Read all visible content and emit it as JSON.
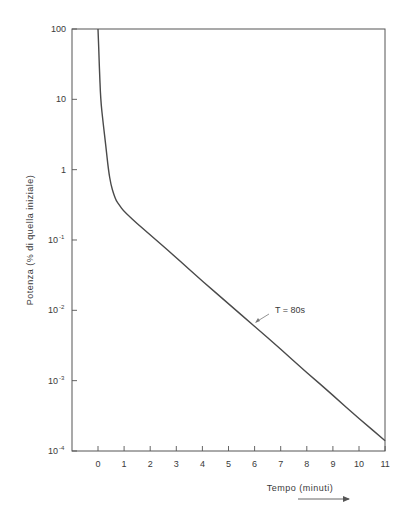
{
  "chart_data": {
    "type": "line",
    "title": "",
    "xlabel": "Tempo (minuti)",
    "ylabel": "Potenza (% di quella iniziale)",
    "xlim": [
      -1,
      11
    ],
    "ylim": [
      0.0001,
      100
    ],
    "yscale": "log",
    "grid": false,
    "x_ticks": [
      "0",
      "1",
      "2",
      "3",
      "4",
      "5",
      "6",
      "7",
      "8",
      "9",
      "10",
      "11"
    ],
    "y_ticks": [
      "100",
      "10",
      "1",
      "10^-1",
      "10^-2",
      "10^-3",
      "10^-4"
    ],
    "series": [
      {
        "name": "Potenza residua",
        "x": [
          0,
          0.05,
          0.1,
          0.2,
          0.3,
          0.4,
          0.5,
          0.6,
          0.7,
          0.8,
          1,
          2,
          3,
          4,
          5,
          6,
          7,
          8,
          9,
          10,
          11
        ],
        "values": [
          100,
          30,
          10,
          4.5,
          2.2,
          1.0,
          0.6,
          0.45,
          0.36,
          0.32,
          0.25,
          0.118,
          0.056,
          0.026,
          0.0124,
          0.0059,
          0.0028,
          0.0013,
          0.00062,
          0.00029,
          0.00014
        ]
      }
    ],
    "annotations": [
      {
        "text": "T = 80s",
        "x": 6.1,
        "y": 0.0069,
        "arrow": true
      }
    ]
  },
  "axes": {
    "x_title": "Tempo (minuti)",
    "y_title": "Potenza (% di quella iniziale)",
    "y_labels": [
      {
        "base": "100",
        "exp": ""
      },
      {
        "base": "10",
        "exp": ""
      },
      {
        "base": "1",
        "exp": ""
      },
      {
        "base": "10",
        "exp": "-1"
      },
      {
        "base": "10",
        "exp": "-2"
      },
      {
        "base": "10",
        "exp": "-3"
      },
      {
        "base": "10",
        "exp": "-4"
      }
    ],
    "x_labels": [
      "0",
      "1",
      "2",
      "3",
      "4",
      "5",
      "6",
      "7",
      "8",
      "9",
      "10",
      "11"
    ]
  },
  "annotation": {
    "label": "T = 80s"
  },
  "colors": {
    "ink": "#3a3a3a",
    "curve": "#4a4a4a",
    "background": "#ffffff"
  }
}
